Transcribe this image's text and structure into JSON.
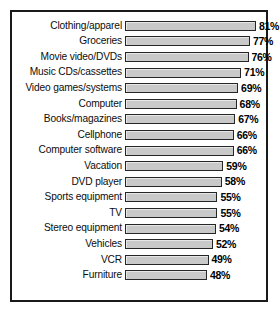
{
  "chart_data": {
    "type": "bar",
    "orientation": "horizontal",
    "title": "",
    "subtitle": "",
    "xlabel": "",
    "ylabel": "",
    "grid": false,
    "legend": null,
    "value_suffix": "%",
    "xlim": [
      0,
      100
    ],
    "categories": [
      "Clothing/apparel",
      "Groceries",
      "Movie video/DVDs",
      "Music CDs/cassettes",
      "Video games/systems",
      "Computer",
      "Books/magazines",
      "Cellphone",
      "Computer software",
      "Vacation",
      "DVD player",
      "Sports equipment",
      "TV",
      "Stereo equipment",
      "Vehicles",
      "VCR",
      "Furniture"
    ],
    "values": [
      81,
      77,
      76,
      71,
      69,
      68,
      67,
      66,
      66,
      59,
      58,
      55,
      55,
      54,
      52,
      49,
      48
    ],
    "labels": [
      "81%",
      "77%",
      "76%",
      "71%",
      "69%",
      "68%",
      "67%",
      "66%",
      "66%",
      "59%",
      "58%",
      "55%",
      "55%",
      "54%",
      "52%",
      "49%",
      "48%"
    ],
    "bar_color": "#c9c9c9",
    "bar_border_color": "#262626",
    "frame_color": "#1a1a1a",
    "background_color": "#ffffff",
    "pixel_scale": {
      "px_per_unit": 1.48,
      "baseline_px": 11
    }
  }
}
